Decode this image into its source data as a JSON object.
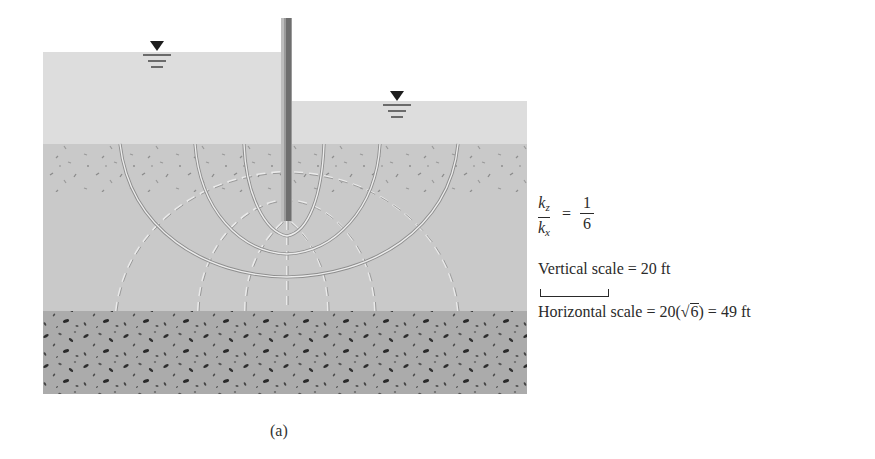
{
  "figure": {
    "caption": "(a)",
    "permeability_ratio": {
      "lhs_numerator": "k",
      "lhs_numerator_sub": "z",
      "lhs_denominator": "k",
      "lhs_denominator_sub": "x",
      "equals": "=",
      "rhs_numerator": "1",
      "rhs_denominator": "6"
    },
    "vertical_scale_label": "Vertical scale = 20 ft",
    "horizontal_scale": {
      "prefix": "Horizontal scale = 20(",
      "sqrt_symbol": "√",
      "sqrt_arg": "6",
      "suffix": ") = 49 ft"
    },
    "colors": {
      "water": "#dcdcdc",
      "permeable_soil": "#c8c8c8",
      "impermeable_layer": "#a9a9a9",
      "sheet_pile": "#8a8a8a",
      "flow_line": "#eeeeee",
      "equipotential_line": "#8c8c8c",
      "text": "#2a2a2a"
    },
    "elements": {
      "upstream_water_level_symbol": "water-table-triangle",
      "downstream_water_level_symbol": "water-table-triangle",
      "flow_lines_count": 3,
      "equipotential_lines_count": 7
    }
  }
}
